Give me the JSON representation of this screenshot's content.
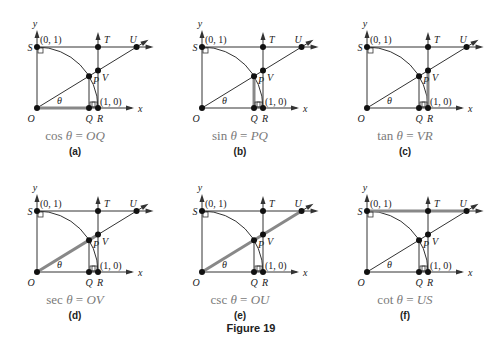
{
  "figure": {
    "title": "Figure 19",
    "labels": {
      "O": "O",
      "Q": "Q",
      "R": "R",
      "S": "S",
      "T": "T",
      "U": "U",
      "V": "V",
      "P": "P",
      "theta": "θ",
      "x": "x",
      "y": "y",
      "coord_01": "(0, 1)",
      "coord_10": "(1, 0)"
    },
    "panels": [
      {
        "id": "a",
        "sub": "(a)",
        "fn": "cos",
        "rhs": "OQ",
        "highlight": "OQ"
      },
      {
        "id": "b",
        "sub": "(b)",
        "fn": "sin",
        "rhs": "PQ",
        "highlight": "PQ"
      },
      {
        "id": "c",
        "sub": "(c)",
        "fn": "tan",
        "rhs": "VR",
        "highlight": "VR"
      },
      {
        "id": "d",
        "sub": "(d)",
        "fn": "sec",
        "rhs": "OV",
        "highlight": "OV"
      },
      {
        "id": "e",
        "sub": "(e)",
        "fn": "csc",
        "rhs": "OU",
        "highlight": "OU"
      },
      {
        "id": "f",
        "sub": "(f)",
        "fn": "cot",
        "rhs": "US",
        "highlight": "US"
      }
    ],
    "colors": {
      "line": "#333333",
      "highlight": "#888888",
      "caption": "#7a7a7a"
    }
  }
}
